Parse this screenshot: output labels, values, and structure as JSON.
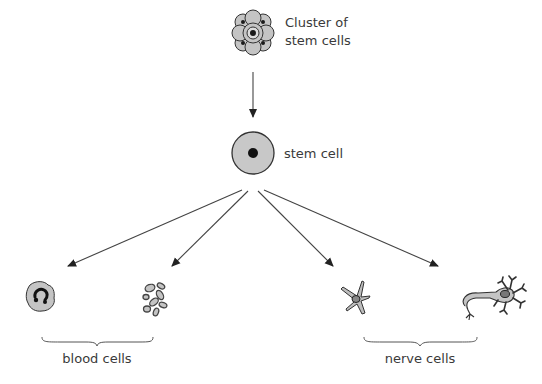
{
  "diagram": {
    "nodes": {
      "cluster": {
        "label_line1": "Cluster of",
        "label_line2": "stem cells",
        "icon": "cell-cluster-icon"
      },
      "stem_cell": {
        "label": "stem cell",
        "icon": "stem-cell-icon"
      },
      "white_blood_cell": {
        "icon": "white-blood-cell-icon"
      },
      "red_blood_cells": {
        "icon": "red-blood-cells-icon"
      },
      "glial_cell": {
        "icon": "star-shaped-nerve-cell-icon"
      },
      "neuron": {
        "icon": "neuron-icon"
      }
    },
    "groups": {
      "blood": {
        "label": "blood cells"
      },
      "nerve": {
        "label": "nerve cells"
      }
    },
    "edges": [
      {
        "from": "cluster",
        "to": "stem_cell"
      },
      {
        "from": "stem_cell",
        "to": "white_blood_cell"
      },
      {
        "from": "stem_cell",
        "to": "red_blood_cells"
      },
      {
        "from": "stem_cell",
        "to": "glial_cell"
      },
      {
        "from": "stem_cell",
        "to": "neuron"
      }
    ],
    "colors": {
      "cell_fill": "#c4c4c4",
      "outline": "#333333",
      "nucleus": "#1a1a1a",
      "text": "#3a3a3a"
    }
  }
}
